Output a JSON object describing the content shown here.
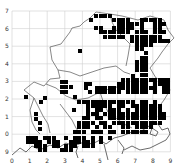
{
  "map": {
    "type": "grid-square distribution map",
    "x_labels": [
      "0",
      "1",
      "2",
      "3",
      "4",
      "5",
      "6",
      "7",
      "8",
      "9"
    ],
    "y_labels": [
      "7",
      "6",
      "5",
      "4",
      "3",
      "2",
      "1",
      "0",
      "9"
    ],
    "grid": {
      "x0": 12,
      "y0": 11,
      "cell": 17.6,
      "cols": 9,
      "rows": 8
    },
    "colors": {
      "grid": "#cfcfcf",
      "square": "#000000",
      "boundary": "#555555",
      "background": "#ffffff"
    },
    "square_size": 4,
    "squares": [
      [
        94,
        14
      ],
      [
        99,
        14
      ],
      [
        103,
        14
      ],
      [
        108,
        14
      ],
      [
        89,
        18
      ],
      [
        112,
        18
      ],
      [
        117,
        18
      ],
      [
        121,
        18
      ],
      [
        126,
        18
      ],
      [
        140,
        18
      ],
      [
        144,
        18
      ],
      [
        149,
        18
      ],
      [
        153,
        18
      ],
      [
        158,
        18
      ],
      [
        117,
        22
      ],
      [
        121,
        22
      ],
      [
        126,
        22
      ],
      [
        130,
        22
      ],
      [
        135,
        22
      ],
      [
        140,
        22
      ],
      [
        153,
        22
      ],
      [
        158,
        22
      ],
      [
        162,
        22
      ],
      [
        94,
        26
      ],
      [
        99,
        26
      ],
      [
        112,
        26
      ],
      [
        117,
        26
      ],
      [
        121,
        26
      ],
      [
        126,
        26
      ],
      [
        130,
        26
      ],
      [
        140,
        26
      ],
      [
        153,
        26
      ],
      [
        158,
        26
      ],
      [
        99,
        30
      ],
      [
        103,
        30
      ],
      [
        108,
        30
      ],
      [
        112,
        30
      ],
      [
        117,
        30
      ],
      [
        121,
        30
      ],
      [
        126,
        30
      ],
      [
        135,
        30
      ],
      [
        140,
        30
      ],
      [
        144,
        30
      ],
      [
        153,
        30
      ],
      [
        158,
        30
      ],
      [
        162,
        30
      ],
      [
        103,
        35
      ],
      [
        108,
        35
      ],
      [
        112,
        35
      ],
      [
        117,
        35
      ],
      [
        121,
        35
      ],
      [
        130,
        35
      ],
      [
        135,
        35
      ],
      [
        140,
        35
      ],
      [
        144,
        35
      ],
      [
        149,
        35
      ],
      [
        153,
        35
      ],
      [
        158,
        35
      ],
      [
        130,
        39
      ],
      [
        135,
        39
      ],
      [
        140,
        39
      ],
      [
        144,
        39
      ],
      [
        149,
        39
      ],
      [
        153,
        39
      ],
      [
        158,
        39
      ],
      [
        162,
        39
      ],
      [
        166,
        39
      ],
      [
        135,
        43
      ],
      [
        140,
        43
      ],
      [
        144,
        43
      ],
      [
        149,
        43
      ],
      [
        135,
        47
      ],
      [
        140,
        47
      ],
      [
        78,
        49
      ],
      [
        144,
        51
      ],
      [
        144,
        56
      ],
      [
        140,
        56
      ],
      [
        135,
        60
      ],
      [
        140,
        60
      ],
      [
        144,
        60
      ],
      [
        135,
        64
      ],
      [
        140,
        64
      ],
      [
        144,
        64
      ],
      [
        144,
        68
      ],
      [
        140,
        68
      ],
      [
        135,
        68
      ],
      [
        140,
        73
      ],
      [
        144,
        73
      ],
      [
        131,
        74
      ],
      [
        121,
        78
      ],
      [
        126,
        78
      ],
      [
        131,
        78
      ],
      [
        135,
        78
      ],
      [
        140,
        78
      ],
      [
        144,
        78
      ],
      [
        149,
        78
      ],
      [
        153,
        78
      ],
      [
        158,
        78
      ],
      [
        162,
        78
      ],
      [
        166,
        78
      ],
      [
        117,
        82
      ],
      [
        121,
        82
      ],
      [
        126,
        82
      ],
      [
        131,
        82
      ],
      [
        135,
        82
      ],
      [
        140,
        82
      ],
      [
        144,
        82
      ],
      [
        153,
        82
      ],
      [
        158,
        82
      ],
      [
        162,
        82
      ],
      [
        166,
        82
      ],
      [
        60,
        80
      ],
      [
        64,
        80
      ],
      [
        84,
        82
      ],
      [
        88,
        82
      ],
      [
        95,
        86
      ],
      [
        99,
        86
      ],
      [
        103,
        86
      ],
      [
        108,
        86
      ],
      [
        112,
        86
      ],
      [
        117,
        86
      ],
      [
        121,
        86
      ],
      [
        126,
        86
      ],
      [
        131,
        86
      ],
      [
        135,
        86
      ],
      [
        140,
        86
      ],
      [
        144,
        86
      ],
      [
        149,
        86
      ],
      [
        153,
        86
      ],
      [
        162,
        86
      ],
      [
        166,
        86
      ],
      [
        60,
        85
      ],
      [
        64,
        85
      ],
      [
        69,
        85
      ],
      [
        84,
        86
      ],
      [
        24,
        95
      ],
      [
        43,
        96
      ],
      [
        60,
        90
      ],
      [
        64,
        90
      ],
      [
        73,
        95
      ],
      [
        88,
        90
      ],
      [
        95,
        90
      ],
      [
        99,
        90
      ],
      [
        103,
        90
      ],
      [
        108,
        90
      ],
      [
        112,
        90
      ],
      [
        117,
        90
      ],
      [
        126,
        90
      ],
      [
        131,
        90
      ],
      [
        135,
        90
      ],
      [
        140,
        90
      ],
      [
        144,
        90
      ],
      [
        153,
        90
      ],
      [
        162,
        90
      ],
      [
        166,
        90
      ],
      [
        39,
        100
      ],
      [
        77,
        100
      ],
      [
        82,
        100
      ],
      [
        86,
        100
      ],
      [
        91,
        100
      ],
      [
        95,
        100
      ],
      [
        99,
        100
      ],
      [
        103,
        100
      ],
      [
        108,
        100
      ],
      [
        112,
        100
      ],
      [
        117,
        100
      ],
      [
        121,
        100
      ],
      [
        126,
        100
      ],
      [
        131,
        100
      ],
      [
        140,
        100
      ],
      [
        144,
        100
      ],
      [
        153,
        100
      ],
      [
        86,
        104
      ],
      [
        91,
        104
      ],
      [
        95,
        104
      ],
      [
        99,
        104
      ],
      [
        103,
        104
      ],
      [
        108,
        104
      ],
      [
        117,
        104
      ],
      [
        121,
        104
      ],
      [
        131,
        104
      ],
      [
        135,
        104
      ],
      [
        140,
        104
      ],
      [
        144,
        104
      ],
      [
        149,
        104
      ],
      [
        153,
        104
      ],
      [
        158,
        104
      ],
      [
        34,
        112
      ],
      [
        72,
        108
      ],
      [
        86,
        108
      ],
      [
        95,
        108
      ],
      [
        99,
        108
      ],
      [
        108,
        108
      ],
      [
        112,
        108
      ],
      [
        117,
        108
      ],
      [
        126,
        108
      ],
      [
        135,
        108
      ],
      [
        140,
        108
      ],
      [
        144,
        108
      ],
      [
        149,
        108
      ],
      [
        153,
        108
      ],
      [
        158,
        108
      ],
      [
        34,
        117
      ],
      [
        86,
        112
      ],
      [
        91,
        112
      ],
      [
        95,
        112
      ],
      [
        103,
        112
      ],
      [
        108,
        112
      ],
      [
        112,
        112
      ],
      [
        117,
        112
      ],
      [
        121,
        112
      ],
      [
        126,
        112
      ],
      [
        131,
        112
      ],
      [
        135,
        112
      ],
      [
        140,
        112
      ],
      [
        144,
        112
      ],
      [
        149,
        112
      ],
      [
        153,
        112
      ],
      [
        158,
        112
      ],
      [
        162,
        112
      ],
      [
        38,
        121
      ],
      [
        82,
        116
      ],
      [
        86,
        116
      ],
      [
        95,
        116
      ],
      [
        99,
        116
      ],
      [
        108,
        116
      ],
      [
        112,
        116
      ],
      [
        117,
        116
      ],
      [
        121,
        116
      ],
      [
        126,
        116
      ],
      [
        131,
        116
      ],
      [
        135,
        116
      ],
      [
        140,
        116
      ],
      [
        144,
        116
      ],
      [
        149,
        116
      ],
      [
        153,
        116
      ],
      [
        158,
        116
      ],
      [
        162,
        116
      ],
      [
        38,
        127
      ],
      [
        77,
        121
      ],
      [
        82,
        121
      ],
      [
        86,
        121
      ],
      [
        91,
        121
      ],
      [
        99,
        121
      ],
      [
        103,
        121
      ],
      [
        112,
        121
      ],
      [
        117,
        121
      ],
      [
        121,
        121
      ],
      [
        126,
        121
      ],
      [
        131,
        121
      ],
      [
        135,
        121
      ],
      [
        140,
        121
      ],
      [
        144,
        121
      ],
      [
        149,
        121
      ],
      [
        153,
        121
      ],
      [
        158,
        121
      ],
      [
        77,
        125
      ],
      [
        82,
        125
      ],
      [
        86,
        125
      ],
      [
        95,
        125
      ],
      [
        103,
        125
      ],
      [
        108,
        125
      ],
      [
        121,
        125
      ],
      [
        126,
        125
      ],
      [
        135,
        125
      ],
      [
        140,
        125
      ],
      [
        144,
        125
      ],
      [
        149,
        125
      ],
      [
        73,
        130
      ],
      [
        77,
        130
      ],
      [
        82,
        130
      ],
      [
        91,
        130
      ],
      [
        95,
        130
      ],
      [
        99,
        130
      ],
      [
        108,
        130
      ],
      [
        112,
        130
      ],
      [
        121,
        130
      ],
      [
        126,
        130
      ],
      [
        131,
        130
      ],
      [
        135,
        130
      ],
      [
        140,
        130
      ],
      [
        144,
        130
      ],
      [
        26,
        136
      ],
      [
        30,
        136
      ],
      [
        34,
        136
      ],
      [
        43,
        136
      ],
      [
        47,
        136
      ],
      [
        52,
        136
      ],
      [
        64,
        136
      ],
      [
        73,
        136
      ],
      [
        77,
        136
      ],
      [
        82,
        136
      ],
      [
        91,
        136
      ],
      [
        99,
        136
      ],
      [
        108,
        136
      ],
      [
        26,
        140
      ],
      [
        30,
        140
      ],
      [
        34,
        140
      ],
      [
        38,
        140
      ],
      [
        47,
        140
      ],
      [
        52,
        140
      ],
      [
        56,
        140
      ],
      [
        69,
        140
      ],
      [
        73,
        140
      ],
      [
        77,
        140
      ],
      [
        82,
        140
      ],
      [
        86,
        140
      ],
      [
        91,
        140
      ],
      [
        99,
        140
      ],
      [
        34,
        144
      ],
      [
        38,
        144
      ],
      [
        43,
        144
      ],
      [
        52,
        144
      ],
      [
        56,
        144
      ],
      [
        64,
        144
      ],
      [
        69,
        144
      ],
      [
        73,
        144
      ],
      [
        82,
        144
      ],
      [
        86,
        144
      ],
      [
        91,
        144
      ],
      [
        38,
        148
      ],
      [
        43,
        148
      ],
      [
        60,
        148
      ],
      [
        64,
        148
      ],
      [
        69,
        148
      ]
    ]
  }
}
